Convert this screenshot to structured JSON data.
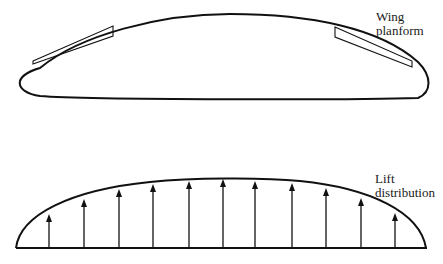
{
  "labels": {
    "wing_line1": "Wing",
    "wing_line2": "planform",
    "lift_line1": "Lift",
    "lift_line2": "distribution"
  },
  "colors": {
    "stroke": "#111111",
    "background": "#ffffff"
  },
  "lift_arrows": {
    "baseline_y": 248,
    "x": [
      49,
      84,
      119,
      153,
      189,
      223,
      255,
      292,
      326,
      361,
      395
    ],
    "tip_y": [
      214,
      199,
      189,
      184,
      181,
      179,
      181,
      183,
      188,
      198,
      213
    ]
  }
}
